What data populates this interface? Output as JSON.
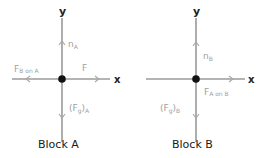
{
  "diagrams": [
    {
      "title": "Block A",
      "axis_x_label": "x",
      "axis_y_label": "y",
      "forces": [
        {
          "name": "n",
          "subscript": "A",
          "direction": "up"
        },
        {
          "name": "F",
          "subscript": "B on A",
          "direction": "left"
        },
        {
          "name": "F",
          "subscript": "",
          "direction": "right"
        },
        {
          "name": "(F",
          "subscript": "g",
          "suffix": ")",
          "suffix_sub": "A",
          "direction": "down"
        }
      ]
    },
    {
      "title": "Block B",
      "axis_x_label": "x",
      "axis_y_label": "y",
      "forces": [
        {
          "name": "n",
          "subscript": "B",
          "direction": "up"
        },
        {
          "name": "F",
          "subscript": "A on B",
          "direction": "right"
        },
        {
          "name": "(F",
          "subscript": "g",
          "suffix": ")",
          "suffix_sub": "B",
          "direction": "down"
        }
      ]
    }
  ],
  "colors": {
    "axis": "#6b6b6b",
    "force": "#a8a8a8",
    "dot": "#111111"
  }
}
